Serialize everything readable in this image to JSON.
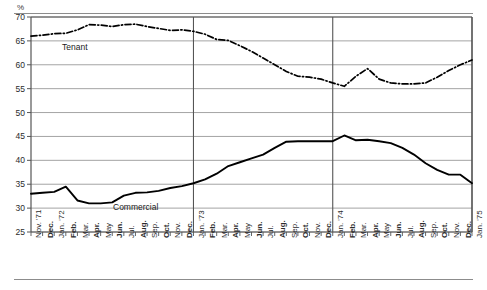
{
  "unit_label": "%",
  "series_labels": {
    "tenant": "Tenant",
    "commercial": "Commercial"
  },
  "chart_data": {
    "type": "line",
    "title": "",
    "xlabel": "",
    "ylabel": "%",
    "ylim": [
      25,
      70
    ],
    "yticks": [
      25,
      30,
      35,
      40,
      45,
      50,
      55,
      60,
      65,
      70
    ],
    "grid": true,
    "legend": "inline-labels",
    "year_dividers": [
      "Jan. '73",
      "Jan. '74",
      "Jan. '75"
    ],
    "categories": [
      "Nov. '71",
      "Dec.",
      "Jan. '72",
      "Feb.",
      "Mar.",
      "Apr.",
      "May",
      "Jun.",
      "Jul.",
      "Aug.",
      "Sep.",
      "Oct.",
      "Nov.",
      "Dec.",
      "Jan. '73",
      "Feb.",
      "Mar.",
      "Apr.",
      "May",
      "Jun.",
      "Jul.",
      "Aug.",
      "Sep.",
      "Oct.",
      "Nov.",
      "Dec.",
      "Jan. '74",
      "Feb.",
      "Mar.",
      "Apr.",
      "May",
      "Jun.",
      "Jul.",
      "Aug.",
      "Sep.",
      "Oct.",
      "Nov.",
      "Dec.",
      "Jan. '75"
    ],
    "bold_categories": [
      "Feb.",
      "Apr.",
      "Jun.",
      "Aug.",
      "Oct.",
      "Dec."
    ],
    "series": [
      {
        "name": "Tenant",
        "style": "dash-dot",
        "values": [
          66.0,
          66.2,
          66.5,
          66.6,
          67.3,
          68.4,
          68.3,
          68.0,
          68.4,
          68.5,
          68.0,
          67.6,
          67.2,
          67.3,
          67.0,
          66.4,
          65.3,
          65.1,
          64.0,
          62.8,
          61.4,
          60.0,
          58.6,
          57.6,
          57.4,
          57.0,
          56.2,
          55.5,
          57.6,
          59.2,
          57.0,
          56.2,
          56.0,
          56.0,
          56.2,
          57.4,
          58.8,
          60.0,
          61.0
        ]
      },
      {
        "name": "Commercial",
        "style": "solid",
        "values": [
          33.0,
          33.2,
          33.4,
          34.5,
          31.6,
          31.0,
          31.0,
          31.2,
          32.6,
          33.2,
          33.3,
          33.6,
          34.2,
          34.6,
          35.2,
          36.0,
          37.2,
          38.8,
          39.6,
          40.4,
          41.2,
          42.6,
          43.9,
          44.0,
          44.0,
          44.0,
          44.0,
          45.2,
          44.2,
          44.3,
          44.0,
          43.6,
          42.6,
          41.2,
          39.4,
          38.0,
          37.0,
          37.0,
          35.2
        ]
      }
    ]
  }
}
